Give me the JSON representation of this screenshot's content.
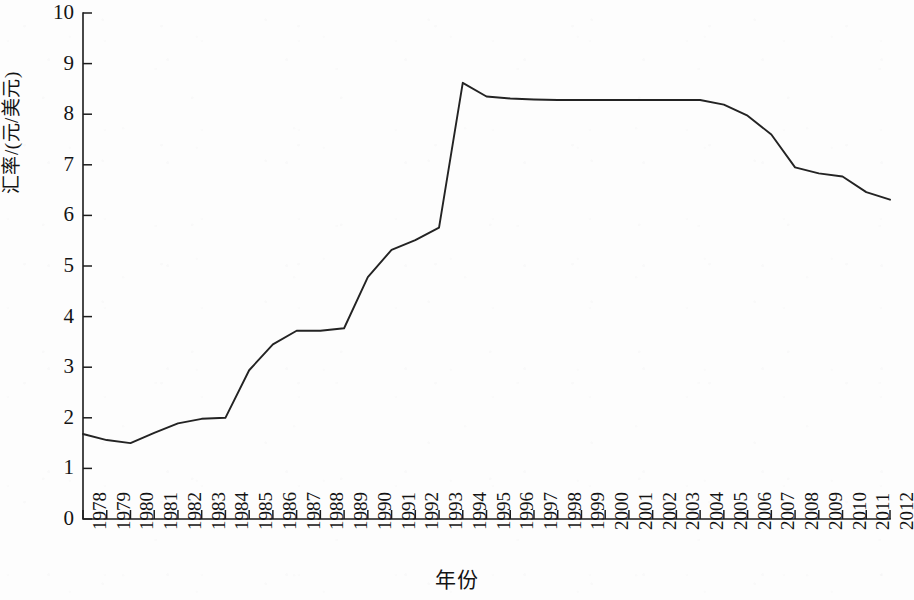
{
  "chart_data": {
    "type": "line",
    "title": "",
    "xlabel": "年份",
    "ylabel": "汇率/(元/美元)",
    "xlim": [
      1978,
      2012
    ],
    "ylim": [
      0,
      10
    ],
    "grid": false,
    "legend": null,
    "y_ticks": [
      "0",
      "1",
      "2",
      "3",
      "4",
      "5",
      "6",
      "7",
      "8",
      "9",
      "10"
    ],
    "y_tick_values": [
      0,
      1,
      2,
      3,
      4,
      5,
      6,
      7,
      8,
      9,
      10
    ],
    "categories": [
      "1978",
      "1979",
      "1980",
      "1981",
      "1982",
      "1983",
      "1984",
      "1985",
      "1986",
      "1987",
      "1988",
      "1989",
      "1990",
      "1991",
      "1992",
      "1993",
      "1994",
      "1995",
      "1996",
      "1997",
      "1998",
      "1999",
      "2000",
      "2001",
      "2002",
      "2003",
      "2004",
      "2005",
      "2006",
      "2007",
      "2008",
      "2009",
      "2010",
      "2011",
      "2012"
    ],
    "series": [
      {
        "name": "人民币对美元汇率",
        "values": [
          1.68,
          1.56,
          1.5,
          1.7,
          1.89,
          1.98,
          2.0,
          2.94,
          3.45,
          3.72,
          3.72,
          3.77,
          4.78,
          5.32,
          5.51,
          5.76,
          8.62,
          8.35,
          8.31,
          8.29,
          8.28,
          8.28,
          8.28,
          8.28,
          8.28,
          8.28,
          8.28,
          8.19,
          7.97,
          7.6,
          6.95,
          6.83,
          6.77,
          6.46,
          6.31
        ]
      }
    ]
  },
  "axes": {
    "x_title": "年份",
    "y_title": "汇率/(元/美元)"
  }
}
